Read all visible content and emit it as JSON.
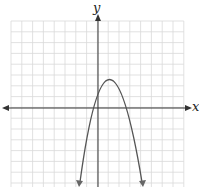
{
  "graph": {
    "x_label": "x",
    "y_label": "y",
    "curve": "downward-opening parabola",
    "vertex_approx": [
      1,
      2.6
    ],
    "x_intercepts_approx": [
      -0.3,
      2.4
    ],
    "grid": {
      "cells_x": 16,
      "cells_y": 16
    }
  },
  "colors": {
    "grid": "#d8d8d8",
    "axis": "#333333",
    "curve": "#555555"
  }
}
